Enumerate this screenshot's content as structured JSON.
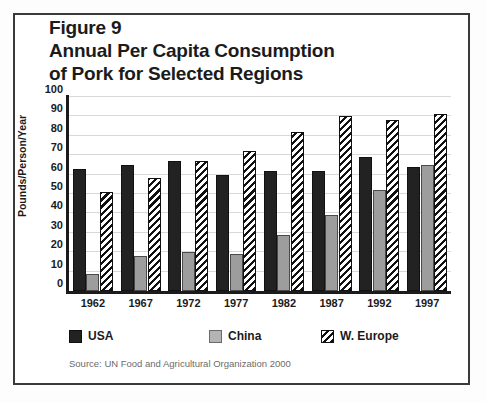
{
  "figure": {
    "title_lines": [
      "Figure 9",
      "Annual Per Capita Consumption",
      "of Pork for Selected Regions"
    ],
    "source": "Source: UN Food and Agricultural Organization 2000"
  },
  "legend": {
    "items": [
      {
        "label": "USA",
        "swatch": "solid-black-swatch",
        "color": "#222222"
      },
      {
        "label": "China",
        "swatch": "solid-gray-swatch",
        "color": "#b4b4b4"
      },
      {
        "label": "W. Europe",
        "swatch": "diagonal-hatch-swatch",
        "color": "#111111"
      }
    ]
  },
  "chart_data": {
    "type": "bar",
    "title": "Figure 9 Annual Per Capita Consumption of Pork for Selected Regions",
    "xlabel": "",
    "ylabel": "Pounds/Person/Year",
    "categories": [
      "1962",
      "1967",
      "1972",
      "1977",
      "1982",
      "1987",
      "1992",
      "1997"
    ],
    "series": [
      {
        "name": "USA",
        "color": "#222222",
        "values": [
          63,
          65,
          67,
          60,
          62,
          62,
          69,
          64
        ]
      },
      {
        "name": "China",
        "color": "#9d9d9d",
        "values": [
          9,
          18,
          20,
          19,
          29,
          39,
          52,
          65
        ]
      },
      {
        "name": "W. Europe",
        "color": "#111111",
        "values": [
          51,
          58,
          67,
          72,
          82,
          90,
          88,
          91
        ]
      }
    ],
    "ylim": [
      0,
      100
    ],
    "yticks": [
      0,
      10,
      20,
      30,
      40,
      50,
      60,
      70,
      80,
      90,
      100
    ],
    "ytick_labels": [
      "0",
      "10",
      "20",
      "30",
      "40",
      "50",
      "60",
      "70",
      "80",
      "90",
      "100"
    ],
    "grid": true,
    "grid_axis": "y",
    "legend_position": "below-plot"
  }
}
